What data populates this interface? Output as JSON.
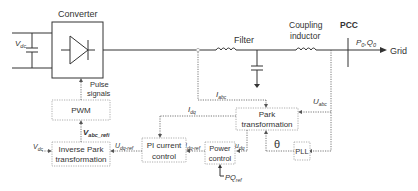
{
  "diagram": {
    "converter": {
      "label": "Converter",
      "dc_voltage": "V",
      "dc_voltage_sub": "dc"
    },
    "filter": {
      "label": "Filter"
    },
    "coupling_inductor": {
      "label_line1": "Coupling",
      "label_line2": "inductor"
    },
    "pcc": {
      "label": "PCC",
      "power": "P",
      "power_sub": "0",
      "sep": ",",
      "reactive": "Q",
      "reactive_sub": "0"
    },
    "grid": {
      "label": "Grid"
    },
    "pulse_signals": {
      "line1": "Pulse",
      "line2": "signals"
    },
    "blocks": {
      "pwm": "PWM",
      "inverse_park": {
        "line1": "Inverse Park",
        "line2": "transformation"
      },
      "pi_current": {
        "line1": "PI current",
        "line2": "control"
      },
      "power_control": {
        "line1": "Power",
        "line2": "control"
      },
      "park": {
        "line1": "Park",
        "line2": "transformation"
      },
      "pll": "PLL"
    },
    "signals": {
      "i_abc": {
        "main": "I",
        "sub": "abc"
      },
      "u_abc": {
        "main": "U",
        "sub": "abc"
      },
      "i_dq": {
        "main": "I",
        "sub": "dq"
      },
      "u_dq": {
        "main": "u",
        "sub": "dq"
      },
      "i_dq_ref": {
        "main": "I",
        "sub": "dq-ref"
      },
      "u_dq_ref": {
        "main": "U",
        "sub": "dq-ref"
      },
      "v_abc_ref": {
        "main": "V",
        "sub": "abc_refi"
      },
      "v_dc": {
        "main": "V",
        "sub": "dc"
      },
      "pq_ref": {
        "main": "PQ",
        "sub": "ref"
      },
      "theta": "θ"
    }
  }
}
